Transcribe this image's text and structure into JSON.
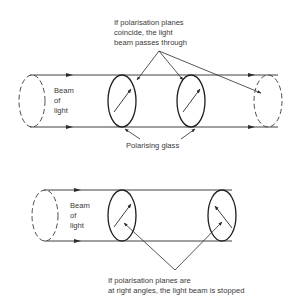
{
  "diagram": {
    "colors": {
      "line": "#2b2b2b",
      "text": "#3a3a3a",
      "background": "#ffffff"
    },
    "top_panel": {
      "caption_lines": [
        "If polarisation planes",
        "coincide, the light",
        "beam passes through"
      ],
      "beam_label_lines": [
        "Beam",
        "of",
        "light"
      ],
      "glass_label": "Polarising glass"
    },
    "bottom_panel": {
      "beam_label_lines": [
        "Beam",
        "of",
        "light"
      ],
      "caption_lines": [
        "If polarisation planes are",
        "at right angles, the light beam is stopped"
      ]
    }
  }
}
